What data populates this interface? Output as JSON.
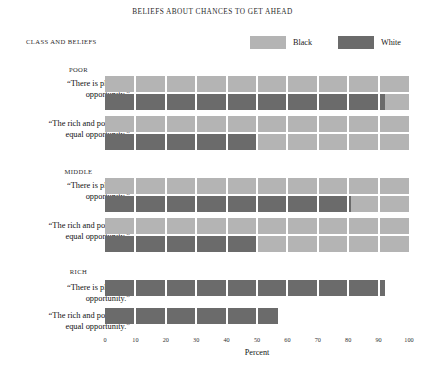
{
  "title": "BELIEFS ABOUT CHANCES TO GET AHEAD",
  "column_header": "CLASS AND BELIEFS",
  "legend": [
    {
      "label": "Black",
      "color": "#b4b4b4"
    },
    {
      "label": "White",
      "color": "#6b6b6b"
    }
  ],
  "axis": {
    "title": "Percent",
    "ticks": [
      "0",
      "10",
      "20",
      "30",
      "40",
      "50",
      "60",
      "70",
      "80",
      "90",
      "100"
    ]
  },
  "groups": [
    {
      "heading": "POOR",
      "rows": [
        {
          "label": "“There is plenty of\nopportunity.”"
        },
        {
          "label": "“The rich and poor have\nequal opportunity.”"
        }
      ]
    },
    {
      "heading": "MIDDLE",
      "rows": [
        {
          "label": "“There is plenty of\nopportunity.”"
        },
        {
          "label": "“The rich and poor have\nequal opportunity.”"
        }
      ]
    },
    {
      "heading": "RICH",
      "rows": [
        {
          "label": "“There is plenty of\nopportunity.”"
        },
        {
          "label": "“The rich and poor have\nequal opportunity.”"
        }
      ]
    }
  ],
  "chart_data": {
    "type": "bar",
    "orientation": "horizontal",
    "title": "BELIEFS ABOUT CHANCES TO GET AHEAD",
    "xlabel": "Percent",
    "ylabel": "CLASS AND BELIEFS",
    "xlim": [
      0,
      100
    ],
    "xticks": [
      0,
      10,
      20,
      30,
      40,
      50,
      60,
      70,
      80,
      90,
      100
    ],
    "grid": false,
    "legend_position": "top-right",
    "segmented_every": 10,
    "categories": [
      "POOR — “There is plenty of opportunity.”",
      "POOR — “The rich and poor have equal opportunity.”",
      "MIDDLE — “There is plenty of opportunity.”",
      "MIDDLE — “The rich and poor have equal opportunity.”",
      "RICH — “There is plenty of opportunity.”",
      "RICH — “The rich and poor have equal opportunity.”"
    ],
    "series": [
      {
        "name": "Black",
        "color": "#b4b4b4",
        "values": [
          100,
          100,
          100,
          100,
          null,
          null
        ]
      },
      {
        "name": "White",
        "color": "#6b6b6b",
        "values": [
          92,
          50,
          81,
          50,
          92,
          57
        ]
      }
    ]
  },
  "render": {
    "track_color": "#c2c2c2",
    "black_color": "#b4b4b4",
    "white_color": "#6b6b6b",
    "rows": [
      {
        "group": 0,
        "q": 0,
        "top": 16,
        "black": 100,
        "white": 92
      },
      {
        "group": 0,
        "q": 1,
        "top": 56,
        "black": 100,
        "white": 50
      },
      {
        "group": 1,
        "q": 0,
        "top": 118,
        "black": 100,
        "white": 81
      },
      {
        "group": 1,
        "q": 1,
        "top": 158,
        "black": 100,
        "white": 50
      },
      {
        "group": 2,
        "q": 0,
        "top": 220,
        "black": null,
        "white": 92
      },
      {
        "group": 2,
        "q": 1,
        "top": 248,
        "black": null,
        "white": 57
      }
    ]
  }
}
